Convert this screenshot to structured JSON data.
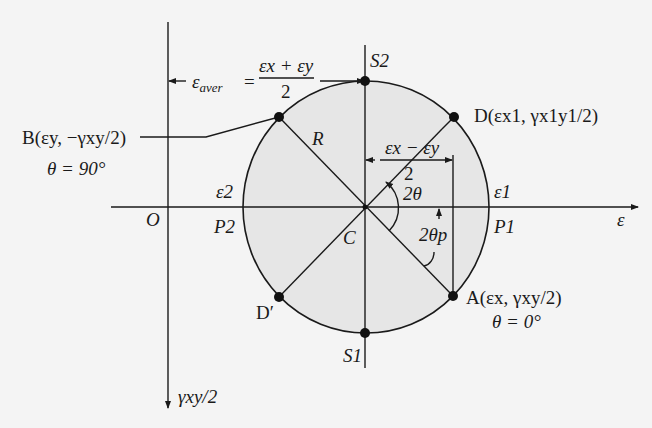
{
  "diagram": {
    "axes": {
      "horizontal_label": "ε",
      "vertical_label": "γxy/2",
      "origin_label": "O"
    },
    "center_label": "C",
    "radius_label": "R",
    "average_strain": {
      "lhs": "ε",
      "lhs_sub": "aver",
      "eq": "=",
      "numerator": "εx + εy",
      "denominator": "2"
    },
    "half_difference": {
      "numerator": "εx − εy",
      "denominator": "2"
    },
    "angles": {
      "two_theta": "2θ",
      "two_theta_p": "2θp"
    },
    "points": {
      "A": {
        "label": "A(εx, γxy/2)",
        "note": "θ = 0°"
      },
      "B": {
        "label": "B(εy, −γxy/2)",
        "note": "θ = 90°"
      },
      "D": {
        "label": "D(εx1, γx1y1/2)"
      },
      "D_prime": {
        "label": "D′"
      },
      "S1": {
        "label": "S1"
      },
      "S2": {
        "label": "S2"
      },
      "P1": {
        "label": "P1"
      },
      "P2": {
        "label": "P2"
      }
    },
    "principal_strains": {
      "e1": "ε1",
      "e2": "ε2"
    },
    "colors": {
      "circle_fill": "#e6e6e6",
      "line": "#1a1a1a",
      "background": "#f4f4f4"
    }
  }
}
